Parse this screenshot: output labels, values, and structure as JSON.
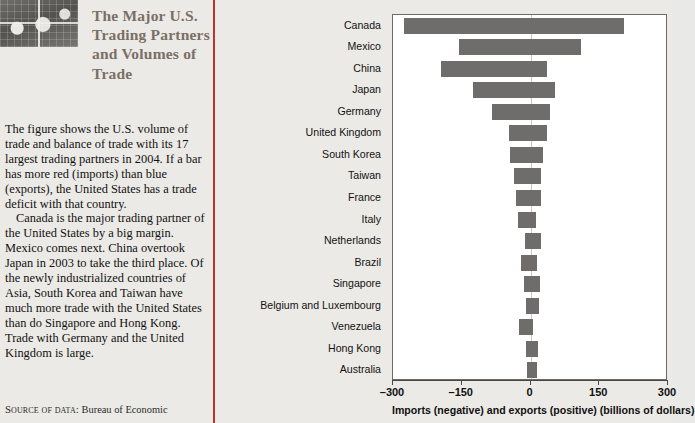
{
  "feature": {
    "title": "The Major U.S. Trading Partners and Volumes of Trade",
    "image_name": "world-map-grid-photo",
    "paragraphs": [
      "The figure shows the U.S. volume of trade and balance of trade with its 17 largest trading partners in 2004. If a bar has more red (imports) than blue (exports), the United States has a trade deficit with that country.",
      "Canada is the major trading partner of the United States by a big margin. Mexico comes next. China overtook Japan in 2003 to take the third place. Of the newly industrialized countries of Asia, South Korea and Taiwan have much more trade with the United States than do Singapore and Hong Kong. Trade with Germany and the United Kingdom is large."
    ],
    "source_label": "Source of data:",
    "source_value": "Bureau of Economic",
    "divider_color": "#b9352c",
    "title_color": "#7a6f66"
  },
  "chart_data": {
    "type": "bar",
    "orientation": "horizontal",
    "title": "",
    "xlabel": "Imports (negative) and exports (positive) (billions of dollars)",
    "ylabel": "",
    "xlim": [
      -300,
      300
    ],
    "xticks": [
      -300,
      -150,
      0,
      150,
      300
    ],
    "xtick_labels": [
      "–300",
      "–150",
      "0",
      "150",
      "300"
    ],
    "grid": false,
    "legend": "none",
    "bar_color": "#6f6d6b",
    "zero_line_color": "#c9c7c4",
    "categories": [
      "Canada",
      "Mexico",
      "China",
      "Japan",
      "Germany",
      "United Kingdom",
      "South Korea",
      "Taiwan",
      "France",
      "Italy",
      "Netherlands",
      "Brazil",
      "Singapore",
      "Belgium and Luxembourg",
      "Venezuela",
      "Hong Kong",
      "Australia"
    ],
    "series": [
      {
        "name": "Imports (negative)",
        "values": [
          -275,
          -155,
          -195,
          -125,
          -84,
          -47,
          -45,
          -35,
          -31,
          -28,
          -12,
          -21,
          -15,
          -10,
          -25,
          -9,
          -8
        ]
      },
      {
        "name": "Exports (positive)",
        "values": [
          203,
          111,
          35,
          53,
          42,
          37,
          27,
          23,
          23,
          11,
          22,
          14,
          20,
          18,
          5,
          16,
          14
        ]
      }
    ]
  }
}
